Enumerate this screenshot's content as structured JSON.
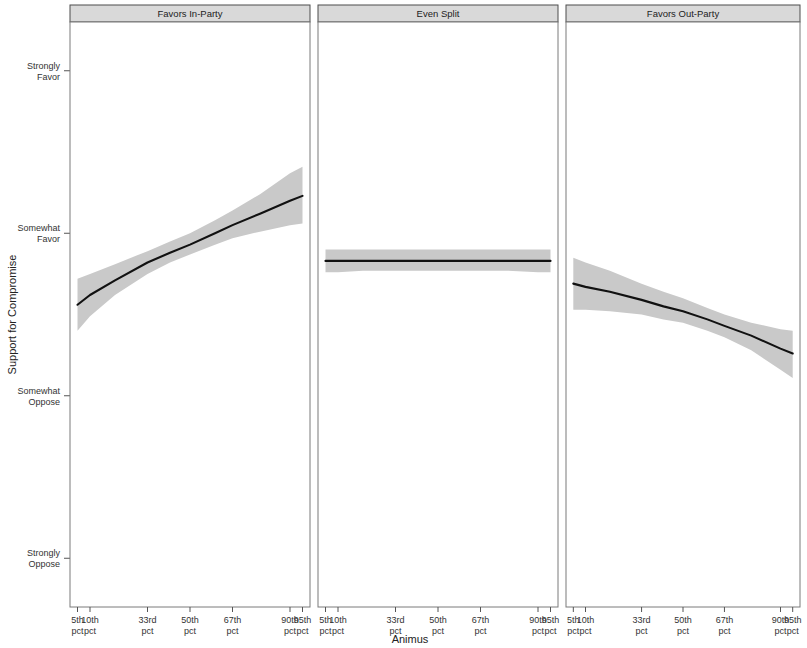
{
  "chart_data": {
    "type": "line",
    "title": "",
    "xlabel": "Animus",
    "ylabel": "Support for Compromise",
    "grid": false,
    "legend": null,
    "facet_variable": "Perceived Benefit of Compromise",
    "x": [
      5,
      10,
      33,
      50,
      67,
      90,
      95
    ],
    "xticklabels": [
      {
        "top": "5th",
        "bottom": "pct"
      },
      {
        "top": "10th",
        "bottom": "pct"
      },
      {
        "top": "33rd",
        "bottom": "pct"
      },
      {
        "top": "50th",
        "bottom": "pct"
      },
      {
        "top": "67th",
        "bottom": "pct"
      },
      {
        "top": "90th",
        "bottom": "pct"
      },
      {
        "top": "95th",
        "bottom": "pct"
      }
    ],
    "yticklabels": [
      {
        "top": "Strongly",
        "bottom": "Favor",
        "value": 4
      },
      {
        "top": "Somewhat",
        "bottom": "Favor",
        "value": 3
      },
      {
        "top": "Somewhat",
        "bottom": "Oppose",
        "value": 2
      },
      {
        "top": "Strongly",
        "bottom": "Oppose",
        "value": 1
      }
    ],
    "ylim": [
      0.7,
      4.3
    ],
    "xlim": [
      2,
      98
    ],
    "ribbon_color": "#c9c9c9",
    "line_color": "#111111",
    "strip_color": "#d9d9d9",
    "panels": [
      {
        "label": "Favors In-Party",
        "x": [
          5,
          10,
          20,
          33,
          42,
          50,
          60,
          67,
          78,
          90,
          95
        ],
        "fit": [
          2.56,
          2.62,
          2.71,
          2.82,
          2.88,
          2.93,
          3.0,
          3.05,
          3.12,
          3.2,
          3.23
        ],
        "lower": [
          2.4,
          2.49,
          2.62,
          2.75,
          2.82,
          2.87,
          2.93,
          2.97,
          3.01,
          3.05,
          3.06
        ],
        "upper": [
          2.72,
          2.75,
          2.81,
          2.89,
          2.95,
          3.0,
          3.08,
          3.14,
          3.24,
          3.37,
          3.41
        ]
      },
      {
        "label": "Even Split",
        "x": [
          5,
          10,
          20,
          33,
          42,
          50,
          60,
          67,
          78,
          90,
          95
        ],
        "fit": [
          2.83,
          2.83,
          2.83,
          2.83,
          2.83,
          2.83,
          2.83,
          2.83,
          2.83,
          2.83,
          2.83
        ],
        "lower": [
          2.76,
          2.76,
          2.77,
          2.77,
          2.77,
          2.77,
          2.77,
          2.77,
          2.77,
          2.76,
          2.76
        ],
        "upper": [
          2.9,
          2.9,
          2.9,
          2.9,
          2.9,
          2.9,
          2.9,
          2.9,
          2.9,
          2.9,
          2.9
        ]
      },
      {
        "label": "Favors Out-Party",
        "x": [
          5,
          10,
          20,
          33,
          42,
          50,
          60,
          67,
          78,
          90,
          95
        ],
        "fit": [
          2.69,
          2.67,
          2.64,
          2.59,
          2.55,
          2.52,
          2.47,
          2.43,
          2.37,
          2.29,
          2.26
        ],
        "lower": [
          2.53,
          2.53,
          2.52,
          2.5,
          2.47,
          2.45,
          2.4,
          2.36,
          2.28,
          2.16,
          2.11
        ],
        "upper": [
          2.85,
          2.82,
          2.77,
          2.69,
          2.64,
          2.6,
          2.54,
          2.5,
          2.45,
          2.41,
          2.4
        ]
      }
    ]
  }
}
